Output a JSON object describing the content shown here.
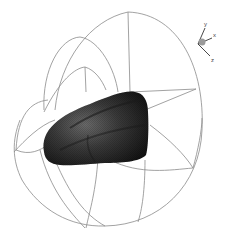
{
  "scene": {
    "background": "#ffffff",
    "wire_color": "#8a8a8a",
    "body_color": "#2a2a2a",
    "body_highlight": "#5a5a5a"
  },
  "axis_triad": {
    "x_label": "x",
    "y_label": "y",
    "z_label": "z"
  }
}
